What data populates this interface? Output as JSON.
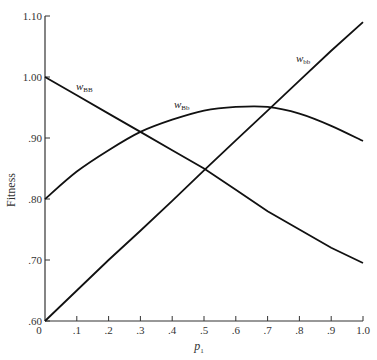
{
  "chart_data": {
    "type": "line",
    "title": "",
    "xlabel": "p1",
    "ylabel": "Fitness",
    "xlim": [
      0,
      1.0
    ],
    "ylim": [
      0.6,
      1.1
    ],
    "grid": false,
    "legend": "inline labels",
    "x_ticks": [
      "0",
      ".1",
      ".2",
      ".3",
      ".4",
      ".5",
      ".6",
      ".7",
      ".8",
      ".9",
      "1.0"
    ],
    "y_ticks": [
      ".60",
      ".70",
      ".80",
      ".90",
      "1.00",
      "1.10"
    ],
    "x": [
      0,
      0.1,
      0.2,
      0.3,
      0.4,
      0.5,
      0.6,
      0.7,
      0.8,
      0.9,
      1.0
    ],
    "series": [
      {
        "name": "w_BB",
        "label_main": "w",
        "label_sub": "BB",
        "values": [
          1.0,
          0.97,
          0.94,
          0.91,
          0.88,
          0.85,
          0.815,
          0.78,
          0.75,
          0.72,
          0.695
        ]
      },
      {
        "name": "w_Bb",
        "label_main": "w",
        "label_sub": "Bb",
        "values": [
          0.8,
          0.845,
          0.88,
          0.91,
          0.93,
          0.945,
          0.951,
          0.951,
          0.94,
          0.92,
          0.895
        ]
      },
      {
        "name": "w_bb",
        "label_main": "w",
        "label_sub": "bb",
        "values": [
          0.6,
          0.65,
          0.7,
          0.748,
          0.797,
          0.847,
          0.896,
          0.945,
          0.994,
          1.043,
          1.09
        ]
      }
    ]
  },
  "axes": {
    "x_label_main": "p",
    "x_label_sub": "1",
    "y_label": "Fitness"
  }
}
